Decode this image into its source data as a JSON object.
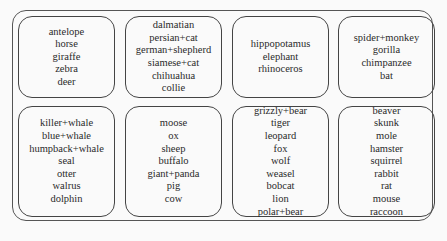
{
  "diagram": {
    "clusters": [
      {
        "items": [
          "antelope",
          "horse",
          "giraffe",
          "zebra",
          "deer"
        ]
      },
      {
        "items": [
          "dalmatian",
          "persian+cat",
          "german+shepherd",
          "siamese+cat",
          "chihuahua",
          "collie"
        ]
      },
      {
        "items": [
          "hippopotamus",
          "elephant",
          "rhinoceros"
        ]
      },
      {
        "items": [
          "spider+monkey",
          "gorilla",
          "chimpanzee",
          "bat"
        ]
      },
      {
        "items": [
          "killer+whale",
          "blue+whale",
          "humpback+whale",
          "seal",
          "otter",
          "walrus",
          "dolphin"
        ]
      },
      {
        "items": [
          "moose",
          "ox",
          "sheep",
          "buffalo",
          "giant+panda",
          "pig",
          "cow"
        ]
      },
      {
        "items": [
          "grizzly+bear",
          "tiger",
          "leopard",
          "fox",
          "wolf",
          "weasel",
          "bobcat",
          "lion",
          "polar+bear"
        ]
      },
      {
        "items": [
          "beaver",
          "skunk",
          "mole",
          "hamster",
          "squirrel",
          "rabbit",
          "rat",
          "mouse",
          "raccoon"
        ]
      }
    ]
  }
}
